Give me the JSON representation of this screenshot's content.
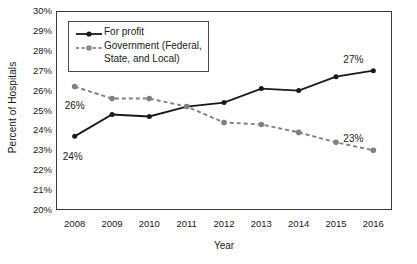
{
  "chart_data": {
    "type": "line",
    "title": "",
    "xlabel": "Year",
    "ylabel": "Percent of Hospitals",
    "categories": [
      "2008",
      "2009",
      "2010",
      "2011",
      "2012",
      "2013",
      "2014",
      "2015",
      "2016"
    ],
    "x": [
      2008,
      2009,
      2010,
      2011,
      2012,
      2013,
      2014,
      2015,
      2016
    ],
    "xlim": [
      2007.5,
      2016.5
    ],
    "ylim": [
      20,
      30
    ],
    "ytick_labels": [
      "20%",
      "21%",
      "22%",
      "23%",
      "24%",
      "25%",
      "26%",
      "27%",
      "28%",
      "29%",
      "30%"
    ],
    "ytick_values": [
      20,
      21,
      22,
      23,
      24,
      25,
      26,
      27,
      28,
      29,
      30
    ],
    "grid": false,
    "legend_position": "top-left",
    "series": [
      {
        "name": "For profit",
        "style": "solid",
        "color": "#1a1a1a",
        "marker": "circle",
        "values": [
          23.7,
          24.8,
          24.7,
          25.2,
          25.4,
          26.1,
          26.0,
          26.7,
          27.0
        ]
      },
      {
        "name": "Government (Federal,\nState, and Local)",
        "style": "dashed",
        "color": "#808080",
        "marker": "circle",
        "values": [
          26.2,
          25.6,
          25.6,
          25.2,
          24.4,
          24.3,
          23.9,
          23.4,
          23.0
        ]
      }
    ],
    "annotations": [
      {
        "text": "26%",
        "series": "Government (Federal, State, and Local)",
        "x": 2008,
        "value": 26.2
      },
      {
        "text": "24%",
        "series": "For profit",
        "x": 2008,
        "value": 23.7
      },
      {
        "text": "27%",
        "series": "For profit",
        "x": 2016,
        "value": 27.0
      },
      {
        "text": "23%",
        "series": "Government (Federal, State, and Local)",
        "x": 2016,
        "value": 23.0
      }
    ]
  },
  "legend": {
    "items": [
      {
        "label": "For profit"
      },
      {
        "label": "Government (Federal,\nState, and Local)"
      }
    ]
  }
}
